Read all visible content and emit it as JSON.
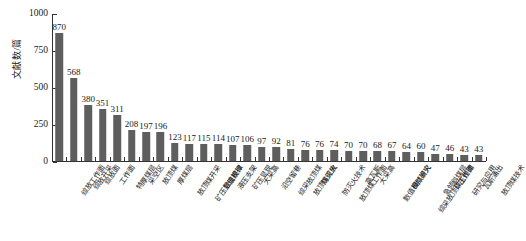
{
  "chart_data": {
    "type": "bar",
    "title": "",
    "xlabel": "",
    "ylabel": "文献数/篇",
    "ylim": [
      0,
      1000
    ],
    "yticks": [
      0,
      250,
      500,
      750,
      1000
    ],
    "grid": false,
    "legend": "none",
    "bar_color": "#5e5e5e",
    "categories": [
      "综放工作面",
      "综放开采",
      "综放面",
      "工作面",
      "特厚煤层",
      "采空区",
      "放顶煤",
      "厚煤层",
      "放顶煤开采",
      "矿压显现规律",
      "数值模拟",
      "液压支架",
      "矿压显现",
      "大采高",
      "沿空留巷",
      "综采放顶煤",
      "放顶煤综放",
      "防灭火",
      "防灭火技术",
      "放顶煤工作面",
      "高瓦斯",
      "大采高",
      "数值模拟研究",
      "自然发火",
      "综采放顶煤工作面",
      "急倾斜煤层",
      "矿压规律",
      "研究与应用",
      "瓦斯涌出",
      "放顶煤技术"
    ],
    "values": [
      870,
      568,
      380,
      351,
      311,
      208,
      197,
      196,
      123,
      117,
      115,
      114,
      107,
      106,
      97,
      92,
      81,
      76,
      76,
      74,
      70,
      70,
      68,
      67,
      64,
      60,
      47,
      46,
      43,
      43
    ]
  }
}
